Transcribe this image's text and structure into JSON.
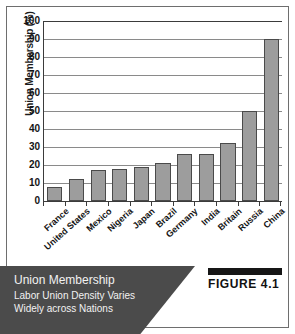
{
  "figure": {
    "badge_label": "FIGURE 4.1",
    "caption_title": "Union Membership",
    "caption_line1": "Labor Union Density Varies",
    "caption_line2": "Widely across Nations",
    "banner_color": "#4b4b4b",
    "badge_rule_color": "#161616"
  },
  "chart_data": {
    "type": "bar",
    "title": "Union Membership",
    "subtitle": "Labor Union Density Varies Widely across Nations",
    "xlabel": "",
    "ylabel": "Union Membership (%)",
    "categories": [
      "France",
      "United States",
      "Mexico",
      "Nigeria",
      "Japan",
      "Brazil",
      "Germany",
      "India",
      "Britain",
      "Russia",
      "China"
    ],
    "values": [
      8,
      12,
      17,
      18,
      19,
      21,
      26,
      26,
      32,
      50,
      90
    ],
    "ylim": [
      0,
      100
    ],
    "ytick_labels": [
      "100",
      "90",
      "80",
      "70",
      "60",
      "50",
      "40",
      "30",
      "20",
      "10",
      "0"
    ],
    "ytick_values": [
      100,
      90,
      80,
      70,
      60,
      50,
      40,
      30,
      20,
      10,
      0
    ],
    "ytick_step": 10,
    "grid": true,
    "legend": false,
    "bar_fill_color": "#9d9d9d",
    "bar_border_color": "#4a4a4a",
    "gridline_color": "#8a8a8a",
    "axis_color": "#3b3b3b"
  }
}
